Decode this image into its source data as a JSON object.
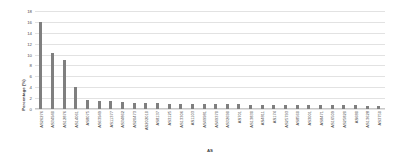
{
  "chart_data": {
    "type": "bar",
    "title": "",
    "xlabel": "AS",
    "ylabel": "Percentage (%)",
    "ylim": [
      0,
      18
    ],
    "yticks": [
      0,
      2,
      4,
      6,
      8,
      10,
      12,
      14,
      16,
      18
    ],
    "grid": true,
    "legend": false,
    "bar_color": "#7f7f7f",
    "categories": [
      "AS26276",
      "AS34940",
      "AS12876",
      "AS14061",
      "AS8075",
      "AS63949",
      "AS11377",
      "AS34862",
      "AS20473",
      "AS202010",
      "AS8137",
      "AS3125",
      "AS13306",
      "AS1103",
      "AS49981",
      "AS49370",
      "AS32690",
      "AS701",
      "AS13830",
      "AS4811",
      "AS174",
      "AS25793",
      "AS8560",
      "AS3001",
      "AS8471",
      "AS16509",
      "AS25820",
      "AS680",
      "AS13628",
      "AS3750"
    ],
    "values": [
      16.0,
      10.2,
      9.0,
      4.0,
      1.6,
      1.4,
      1.4,
      1.2,
      1.1,
      1.1,
      1.1,
      1.0,
      1.0,
      1.0,
      0.9,
      0.9,
      0.9,
      0.9,
      0.8,
      0.8,
      0.7,
      0.8,
      0.8,
      0.8,
      0.7,
      0.7,
      0.7,
      0.7,
      0.6,
      0.6
    ]
  }
}
